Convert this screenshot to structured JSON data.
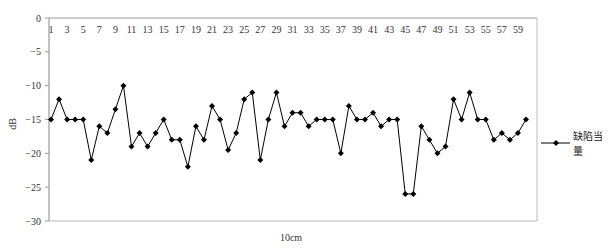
{
  "chart_data": {
    "type": "line",
    "title": "",
    "xlabel": "10cm",
    "ylabel": "dB",
    "ylim": [
      -30,
      0
    ],
    "yticks": [
      0,
      -5,
      -10,
      -15,
      -20,
      -25,
      -30
    ],
    "x": [
      1,
      2,
      3,
      4,
      5,
      6,
      7,
      8,
      9,
      10,
      11,
      12,
      13,
      14,
      15,
      16,
      17,
      18,
      19,
      20,
      21,
      22,
      23,
      24,
      25,
      26,
      27,
      28,
      29,
      30,
      31,
      32,
      33,
      34,
      35,
      36,
      37,
      38,
      39,
      40,
      41,
      42,
      43,
      44,
      45,
      46,
      47,
      48,
      49,
      50,
      51,
      52,
      53,
      54,
      55,
      56,
      57,
      58,
      59,
      60
    ],
    "xtick_labels": [
      "1",
      "3",
      "5",
      "7",
      "9",
      "11",
      "13",
      "15",
      "17",
      "19",
      "21",
      "23",
      "25",
      "27",
      "29",
      "31",
      "33",
      "35",
      "37",
      "39",
      "41",
      "43",
      "45",
      "47",
      "49",
      "51",
      "53",
      "55",
      "57",
      "59"
    ],
    "xtick_position": "top",
    "grid": false,
    "legend_position": "right",
    "series": [
      {
        "name": "缺陷当量",
        "marker": "diamond",
        "color": "#000000",
        "values": [
          -15,
          -12,
          -15,
          -15,
          -15,
          -21,
          -16,
          -17,
          -13.5,
          -10,
          -19,
          -17,
          -19,
          -17,
          -15,
          -18,
          -18,
          -22,
          -16,
          -18,
          -13,
          -15,
          -19.5,
          -17,
          -12,
          -11,
          -21,
          -15,
          -11,
          -16,
          -14,
          -14,
          -16,
          -15,
          -15,
          -15,
          -20,
          -13,
          -15,
          -15,
          -14,
          -16,
          -15,
          -15,
          -26,
          -26,
          -16,
          -18,
          -20,
          -19,
          -12,
          -15,
          -11,
          -15,
          -15,
          -18,
          -17,
          -18,
          -17,
          -15
        ]
      }
    ]
  },
  "legend": {
    "label": "缺陷当量"
  },
  "axis": {
    "xlabel": "10cm",
    "ylabel": "dB"
  }
}
